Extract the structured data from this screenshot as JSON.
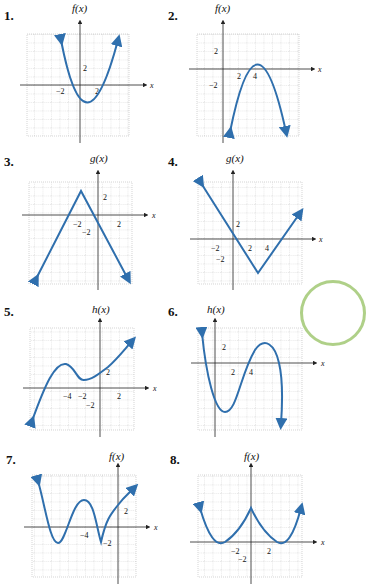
{
  "graphs": [
    {
      "number": "1.",
      "func": "f(x)",
      "xlabel": "x",
      "xticks": [
        "-2",
        "2"
      ],
      "yticks": [
        "2"
      ],
      "shape": "upward parabola, vertex ~(1,-4), roots ~-1.6 and ~3.3"
    },
    {
      "number": "2.",
      "func": "f(x)",
      "xlabel": "x",
      "xticks": [
        "2",
        "4"
      ],
      "yticks": [
        "2",
        "-2"
      ],
      "shape": "downward parabola, vertex ~(4,1), roots ~3 and ~5"
    },
    {
      "number": "3.",
      "func": "g(x)",
      "xlabel": "x",
      "xticks": [
        "-2",
        "2"
      ],
      "yticks": [
        "2",
        "-2"
      ],
      "shape": "inverted V, vertex ~(-2,3)"
    },
    {
      "number": "4.",
      "func": "g(x)",
      "xlabel": "x",
      "xticks": [
        "-2",
        "2",
        "4"
      ],
      "yticks": [
        "2",
        "-2"
      ],
      "shape": "V, vertex ~(3,-4)"
    },
    {
      "number": "5.",
      "func": "h(x)",
      "xlabel": "x",
      "xticks": [
        "-4",
        "-2",
        "2"
      ],
      "yticks": [
        "2",
        "-2"
      ],
      "shape": "cubic, local max ~(-4,3), local min ~(-2,1)"
    },
    {
      "number": "6.",
      "func": "h(x)",
      "xlabel": "x",
      "xticks": [
        "2",
        "4"
      ],
      "yticks": [
        "2"
      ],
      "shape": "cubic, local min ~(1,-6), local max ~(5,2)"
    },
    {
      "number": "7.",
      "func": "f(x)",
      "xlabel": "x",
      "xticks": [
        "-4",
        "-2"
      ],
      "yticks": [
        "2"
      ],
      "shape": "wave with cusp at ~(-2,-2)"
    },
    {
      "number": "8.",
      "func": "f(x)",
      "xlabel": "x",
      "xticks": [
        "-2",
        "2"
      ],
      "yticks": [
        "-2"
      ],
      "shape": "two parabolic arcs with cusp at (0,4), minima at (-3,0),(3,0)"
    }
  ],
  "colors": {
    "curve": "#2f6fad",
    "grid": "#b8b8b8",
    "axis": "#222222"
  }
}
